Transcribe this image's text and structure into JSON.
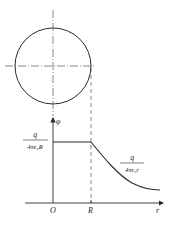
{
  "diagram": {
    "labels": {
      "phi_axis": "φ",
      "r_axis": "r",
      "origin": "O",
      "radius_tick": "R",
      "inside_numerator": "q",
      "inside_denominator": "4πε₀R",
      "outside_numerator": "q",
      "outside_denominator": "4πε₀r"
    },
    "colors": {
      "line": "#2a2a2a",
      "dash": "#555555"
    }
  }
}
